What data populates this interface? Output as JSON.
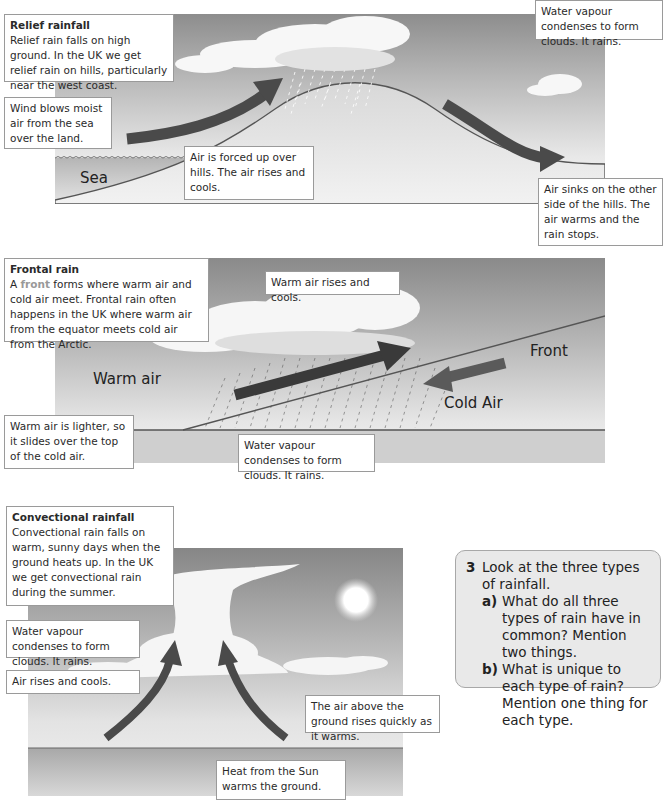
{
  "relief": {
    "title": "Relief rainfall",
    "intro": "Relief rain falls on high ground. In the UK we get relief rain on hills, particularly near the west coast.",
    "wind_note": "Wind blows moist air from the sea over the land.",
    "forced_up_note": "Air is forced up over hills. The air rises and cools.",
    "condense_note": "Water vapour condenses to form clouds. It rains.",
    "sink_note": "Air sinks on the other side of the hills. The air warms and the rain stops.",
    "sea_label": "Sea"
  },
  "frontal": {
    "title": "Frontal rain",
    "intro_pre": "A ",
    "intro_keyword": "front",
    "intro_post": " forms where warm air and cold air meet. Frontal rain often happens in the UK where warm air from the equator meets cold air from the Arctic.",
    "rise_note": "Warm air rises and cools.",
    "lighter_note": "Warm air is lighter, so it slides over the top of the cold air.",
    "condense_note": "Water vapour condenses to form clouds. It rains.",
    "warm_air_label": "Warm air",
    "front_label": "Front",
    "cold_air_label": "Cold Air"
  },
  "convectional": {
    "title": "Convectional rainfall",
    "intro": "Convectional rain falls on warm, sunny days when the ground heats up. In the UK we get convectional rain during the summer.",
    "condense_note": "Water vapour condenses to form clouds. It rains.",
    "rise_note": "Air rises and cools.",
    "air_above_note": "The air above the ground rises quickly as it warms.",
    "heat_note": "Heat from the Sun warms the ground."
  },
  "question": {
    "number": "3",
    "stem": "Look at the three types of rainfall.",
    "parts": [
      {
        "letter": "a)",
        "text": "What do all three types of rain have in common? Mention two things."
      },
      {
        "letter": "b)",
        "text": "What is unique to each type of rain? Mention one thing for each type."
      }
    ]
  },
  "colors": {
    "arrow": "#4a4a4a",
    "question_bg": "#e9e9e9",
    "keyword": "#999999"
  }
}
